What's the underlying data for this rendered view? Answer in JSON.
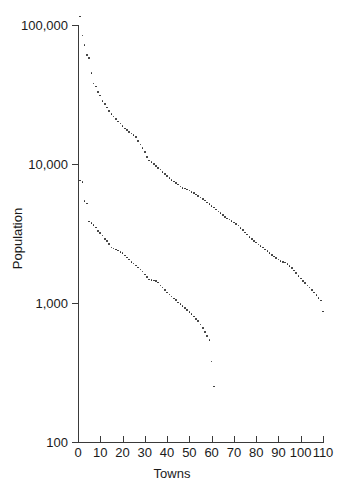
{
  "chart_data": {
    "type": "scatter",
    "title": "",
    "xlabel": "Towns",
    "ylabel": "Population",
    "yscale": "log",
    "xlim": [
      0,
      110
    ],
    "ylim": [
      100,
      100000
    ],
    "grid": false,
    "legend": "none",
    "ytick_labels": [
      "100,000",
      "10,000",
      "1,000",
      "100"
    ],
    "ytick_values": [
      100000,
      10000,
      1000,
      100
    ],
    "xtick_labels": [
      "0",
      "10",
      "20",
      "30",
      "40",
      "50",
      "60",
      "70",
      "80",
      "90",
      "100",
      "110"
    ],
    "xtick_values": [
      0,
      10,
      20,
      30,
      40,
      50,
      60,
      70,
      80,
      90,
      100,
      110
    ],
    "marker_color": "#262626",
    "axis_color": "#3a3a3a",
    "series": [
      {
        "name": "upper",
        "x": [
          1,
          2,
          3,
          4,
          5,
          6,
          7,
          8,
          9,
          10,
          11,
          12,
          13,
          14,
          15,
          16,
          17,
          18,
          19,
          20,
          21,
          22,
          23,
          24,
          25,
          26,
          27,
          28,
          29,
          30,
          31,
          32,
          33,
          34,
          35,
          36,
          37,
          38,
          39,
          40,
          41,
          42,
          43,
          44,
          45,
          46,
          47,
          48,
          49,
          50,
          51,
          52,
          53,
          54,
          55,
          56,
          57,
          58,
          59,
          60,
          61,
          62,
          63,
          64,
          65,
          66,
          67,
          68,
          69,
          70,
          71,
          72,
          73,
          74,
          75,
          76,
          77,
          78,
          79,
          80,
          81,
          82,
          83,
          84,
          85,
          86,
          87,
          88,
          89,
          90,
          91,
          92,
          93,
          94,
          95,
          96,
          97,
          98,
          99,
          100,
          101,
          102,
          103,
          104,
          105,
          106,
          107,
          108,
          109,
          110
        ],
        "y": [
          115000,
          84000,
          72000,
          61000,
          58000,
          45000,
          38000,
          36000,
          33000,
          31000,
          28500,
          27000,
          25500,
          24000,
          23000,
          22000,
          21000,
          20200,
          19500,
          18800,
          18000,
          17500,
          17000,
          16600,
          16200,
          15600,
          14600,
          13800,
          13000,
          12200,
          11200,
          10600,
          10300,
          10000,
          9700,
          9400,
          9100,
          8800,
          8500,
          8200,
          7900,
          7700,
          7500,
          7300,
          7100,
          6900,
          6750,
          6650,
          6550,
          6450,
          6300,
          6200,
          6050,
          5900,
          5750,
          5600,
          5450,
          5300,
          5150,
          5000,
          4850,
          4700,
          4560,
          4420,
          4280,
          4150,
          4050,
          3980,
          3900,
          3800,
          3700,
          3600,
          3480,
          3350,
          3220,
          3100,
          2980,
          2880,
          2800,
          2720,
          2640,
          2570,
          2500,
          2430,
          2360,
          2290,
          2220,
          2160,
          2100,
          2050,
          2010,
          1980,
          1950,
          1900,
          1840,
          1780,
          1710,
          1640,
          1570,
          1500,
          1440,
          1390,
          1340,
          1290,
          1240,
          1190,
          1140,
          1090,
          1040,
          870
        ]
      },
      {
        "name": "lower",
        "x": [
          1,
          2,
          3,
          4,
          5,
          6,
          7,
          8,
          9,
          10,
          11,
          12,
          13,
          14,
          15,
          16,
          17,
          18,
          19,
          20,
          21,
          22,
          23,
          24,
          25,
          26,
          27,
          28,
          29,
          30,
          31,
          32,
          33,
          34,
          35,
          36,
          37,
          38,
          39,
          40,
          41,
          42,
          43,
          44,
          45,
          46,
          47,
          48,
          49,
          50,
          51,
          52,
          53,
          54,
          55,
          56,
          57,
          58,
          59,
          60,
          61
        ],
        "y": [
          7600,
          7450,
          5400,
          5200,
          3850,
          3750,
          3650,
          3500,
          3300,
          3200,
          3050,
          2900,
          2800,
          2650,
          2500,
          2460,
          2430,
          2380,
          2330,
          2280,
          2200,
          2120,
          2050,
          1980,
          1920,
          1860,
          1800,
          1740,
          1680,
          1600,
          1540,
          1480,
          1460,
          1450,
          1440,
          1400,
          1340,
          1290,
          1240,
          1190,
          1150,
          1110,
          1080,
          1050,
          1010,
          980,
          950,
          920,
          890,
          860,
          830,
          800,
          770,
          740,
          700,
          660,
          620,
          580,
          540,
          380,
          250
        ]
      }
    ]
  }
}
